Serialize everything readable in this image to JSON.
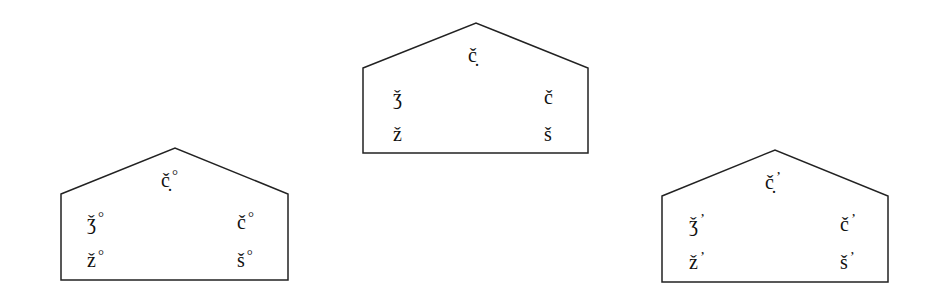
{
  "diagram": {
    "title": "",
    "houses": [
      {
        "id": "center",
        "marker": "",
        "outline": {
          "left": 363,
          "right": 588,
          "apex_x": 476,
          "apex_y": 23,
          "shoulder_y": 68,
          "bottom_y": 153
        },
        "labels": {
          "top": "č̣",
          "mid_left": "ǯ",
          "mid_right": "č",
          "bottom_left": "ž",
          "bottom_right": "š"
        }
      },
      {
        "id": "left",
        "marker": "°",
        "outline": {
          "left": 61,
          "right": 288,
          "apex_x": 175,
          "apex_y": 148,
          "shoulder_y": 194,
          "bottom_y": 280
        },
        "labels": {
          "top": "č̣",
          "mid_left": "ǯ",
          "mid_right": "č",
          "bottom_left": "ž",
          "bottom_right": "š"
        }
      },
      {
        "id": "right",
        "marker": "’",
        "outline": {
          "left": 662,
          "right": 888,
          "apex_x": 775,
          "apex_y": 150,
          "shoulder_y": 196,
          "bottom_y": 282
        },
        "labels": {
          "top": "č̣",
          "mid_left": "ǯ",
          "mid_right": "č",
          "bottom_left": "ž",
          "bottom_right": "š"
        }
      }
    ],
    "stroke_color": "#222222"
  }
}
